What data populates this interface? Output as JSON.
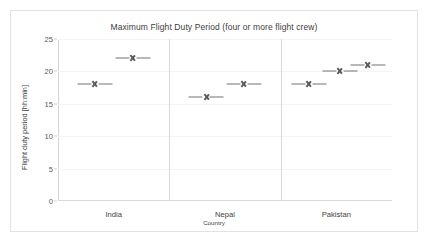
{
  "chart_data": {
    "type": "scatter",
    "title": "Maximum Flight Duty Period (four or more flight crew)",
    "xlabel": "Country",
    "ylabel": "Flight duty period [hh:min]",
    "categories": [
      "India",
      "Nepal",
      "Pakistan"
    ],
    "yticks": [
      0,
      5,
      10,
      15,
      20,
      25
    ],
    "ylim": [
      0,
      25
    ],
    "grid": true,
    "legend": false,
    "marker_style": "x-with-horizontal-whiskers",
    "marker_color": "#595959",
    "frame_color": "#e2e2e2",
    "background": "#ffffff",
    "groups": [
      {
        "category": "India",
        "points": [
          {
            "value": 18,
            "x_offset": 0.33
          },
          {
            "value": 22,
            "x_offset": 0.67
          }
        ]
      },
      {
        "category": "Nepal",
        "points": [
          {
            "value": 16,
            "x_offset": 0.33
          },
          {
            "value": 18,
            "x_offset": 0.67
          }
        ]
      },
      {
        "category": "Pakistan",
        "points": [
          {
            "value": 18,
            "x_offset": 0.25
          },
          {
            "value": 20,
            "x_offset": 0.53
          },
          {
            "value": 21,
            "x_offset": 0.78
          }
        ]
      }
    ]
  }
}
